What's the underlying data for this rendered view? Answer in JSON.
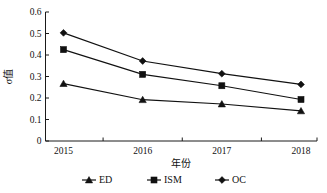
{
  "chart_data": {
    "type": "line",
    "title": "",
    "xlabel": "年份",
    "ylabel": "σ值",
    "categories": [
      "2015",
      "2016",
      "2017",
      "2018"
    ],
    "x": [
      2015,
      2016,
      2017,
      2018
    ],
    "ylim": [
      0,
      0.6
    ],
    "yticks": [
      "0",
      "0.1",
      "0.2",
      "0.3",
      "0.4",
      "0.5",
      "0.6"
    ],
    "ytick_values": [
      0,
      0.1,
      0.2,
      0.3,
      0.4,
      0.5,
      0.6
    ],
    "grid": false,
    "legend_position": "bottom",
    "series": [
      {
        "name": "ED",
        "marker": "triangle",
        "color": "#111111",
        "values": [
          0.267,
          0.192,
          0.172,
          0.14
        ]
      },
      {
        "name": "ISM",
        "marker": "square",
        "color": "#111111",
        "values": [
          0.425,
          0.31,
          0.257,
          0.193
        ]
      },
      {
        "name": "OC",
        "marker": "diamond",
        "color": "#111111",
        "values": [
          0.503,
          0.372,
          0.313,
          0.263
        ]
      }
    ]
  }
}
